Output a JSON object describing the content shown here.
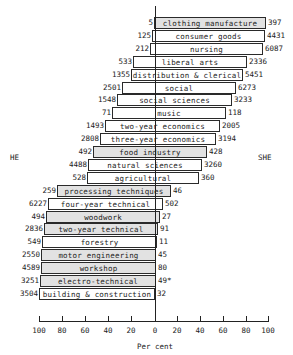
{
  "chart_data": {
    "type": "bar",
    "subtype": "diverging-horizontal-pyramid",
    "title": "",
    "xlabel": "Per cent",
    "left_label": "HE",
    "right_label": "SHE",
    "x_ticks": [
      "100",
      "80",
      "60",
      "40",
      "20",
      "0",
      "20",
      "40",
      "60",
      "80",
      "100"
    ],
    "xlim": [
      -100,
      100
    ],
    "grid": false,
    "categories": [
      "clothing manufacture",
      "consumer goods",
      "nursing",
      "liberal arts",
      "distribution & clerical",
      "social",
      "social sciences",
      "music",
      "two-year economics",
      "three-year economics",
      "food industry",
      "natural sciences",
      "agricultural",
      "processing techniques",
      "four-year technical",
      "woodwork",
      "two-year technical",
      "forestry",
      "motor engineering",
      "workshop",
      "electro-technical",
      "building & construction"
    ],
    "series": [
      {
        "name": "HE (count)",
        "values": [
          5,
          125,
          212,
          533,
          1355,
          2501,
          1548,
          71,
          1493,
          2808,
          492,
          4488,
          528,
          259,
          6227,
          494,
          2836,
          549,
          2550,
          4589,
          3251,
          3504
        ]
      },
      {
        "name": "SHE (count)",
        "values": [
          397,
          4431,
          6087,
          2336,
          5451,
          6273,
          3233,
          118,
          2005,
          3194,
          428,
          3260,
          360,
          46,
          502,
          27,
          91,
          11,
          45,
          80,
          49,
          32
        ]
      },
      {
        "name": "HE (per cent, estimated)",
        "values": [
          1,
          3,
          4,
          19,
          21,
          29,
          33,
          38,
          43,
          48,
          54,
          58,
          59,
          85,
          93,
          95,
          97,
          98,
          98,
          98,
          99,
          99
        ]
      },
      {
        "name": "SHE (per cent, estimated)",
        "values": [
          99,
          97,
          96,
          81,
          79,
          71,
          67,
          62,
          57,
          52,
          46,
          42,
          41,
          15,
          7,
          5,
          3,
          2,
          2,
          2,
          1,
          1
        ]
      }
    ],
    "right_value_labels": [
      "397",
      "4431",
      "6087",
      "2336",
      "5451",
      "6273",
      "3233",
      "118",
      "2005",
      "3194",
      "428",
      "3260",
      "360",
      "46",
      "502",
      "27",
      "91",
      "11",
      "45",
      "80",
      "49*",
      "32"
    ],
    "shaded_categories": [
      "clothing manufacture",
      "food industry",
      "processing techniques",
      "woodwork",
      "two-year technical",
      "motor engineering",
      "workshop",
      "electro-technical"
    ]
  },
  "rows": [
    {
      "label": "clothing manufacture",
      "he": "5",
      "she": "397",
      "x0": 154,
      "x1": 266,
      "shaded": true
    },
    {
      "label": "consumer goods",
      "he": "125",
      "she": "4431",
      "x0": 152,
      "x1": 265,
      "shaded": false
    },
    {
      "label": "nursing",
      "he": "212",
      "she": "6087",
      "x0": 150,
      "x1": 263,
      "shaded": false
    },
    {
      "label": "liberal arts",
      "he": "533",
      "she": "2336",
      "x0": 133,
      "x1": 247,
      "shaded": false
    },
    {
      "label": "distribution & clerical",
      "he": "1355",
      "she": "5451",
      "x0": 131,
      "x1": 243,
      "shaded": false
    },
    {
      "label": "social",
      "he": "2501",
      "she": "6273",
      "x0": 122,
      "x1": 236,
      "shaded": false
    },
    {
      "label": "social sciences",
      "he": "1548",
      "she": "3233",
      "x0": 117,
      "x1": 232,
      "shaded": false
    },
    {
      "label": "music",
      "he": "71",
      "she": "118",
      "x0": 112,
      "x1": 226,
      "shaded": false
    },
    {
      "label": "two-year economics",
      "he": "1493",
      "she": "2005",
      "x0": 105,
      "x1": 220,
      "shaded": false
    },
    {
      "label": "three-year economics",
      "he": "2808",
      "she": "3194",
      "x0": 100,
      "x1": 216,
      "shaded": false
    },
    {
      "label": "food industry",
      "he": "492",
      "she": "428",
      "x0": 93,
      "x1": 207,
      "shaded": true
    },
    {
      "label": "natural sciences",
      "he": "4488",
      "she": "3260",
      "x0": 88,
      "x1": 202,
      "shaded": false
    },
    {
      "label": "agricultural",
      "he": "528",
      "she": "360",
      "x0": 87,
      "x1": 199,
      "shaded": false
    },
    {
      "label": "processing techniques",
      "he": "259",
      "she": "46",
      "x0": 57,
      "x1": 171,
      "shaded": true
    },
    {
      "label": "four-year technical",
      "he": "6227",
      "she": "502",
      "x0": 48,
      "x1": 163,
      "shaded": false
    },
    {
      "label": "woodwork",
      "he": "494",
      "she": "27",
      "x0": 46,
      "x1": 160,
      "shaded": true
    },
    {
      "label": "two-year technical",
      "he": "2836",
      "she": "91",
      "x0": 44,
      "x1": 158,
      "shaded": true
    },
    {
      "label": "forestry",
      "he": "549",
      "she": "11",
      "x0": 42,
      "x1": 157,
      "shaded": false
    },
    {
      "label": "motor engineering",
      "he": "2550",
      "she": "45",
      "x0": 41,
      "x1": 156,
      "shaded": true
    },
    {
      "label": "workshop",
      "he": "4589",
      "she": "80",
      "x0": 41,
      "x1": 156,
      "shaded": true
    },
    {
      "label": "electro-technical",
      "he": "3251",
      "she": "49*",
      "x0": 40,
      "x1": 156,
      "shaded": true
    },
    {
      "label": "building & construction",
      "he": "3504",
      "she": "32",
      "x0": 39,
      "x1": 155,
      "shaded": false
    }
  ]
}
